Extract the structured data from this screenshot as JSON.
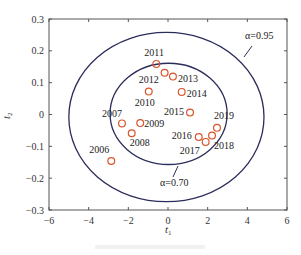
{
  "chart_data": {
    "type": "scatter",
    "title": "",
    "xlabel": "t1",
    "ylabel": "t2",
    "xlim": [
      -6,
      6
    ],
    "ylim": [
      -0.3,
      0.3
    ],
    "xticks": [
      -6,
      -4,
      -2,
      0,
      2,
      4,
      6
    ],
    "xtick_labels": [
      "−6",
      "−4",
      "−2",
      "0",
      "2",
      "4",
      "6"
    ],
    "yticks": [
      0.3,
      0.2,
      0.1,
      0,
      -0.1,
      -0.2,
      -0.3
    ],
    "ytick_labels": [
      "0.3",
      "0.2",
      "0.1",
      "0",
      "−0.1",
      "−0.2",
      "−0.3"
    ],
    "grid": false,
    "legend": null,
    "series": [
      {
        "name": "years",
        "marker": "open-circle",
        "color": "#d9542b",
        "points": [
          {
            "label": "2006",
            "x": -2.86,
            "y": -0.146
          },
          {
            "label": "2007",
            "x": -2.32,
            "y": -0.028
          },
          {
            "label": "2008",
            "x": -1.83,
            "y": -0.059
          },
          {
            "label": "2009",
            "x": -1.4,
            "y": -0.027
          },
          {
            "label": "2010",
            "x": -0.97,
            "y": 0.072
          },
          {
            "label": "2011",
            "x": -0.59,
            "y": 0.159
          },
          {
            "label": "2012",
            "x": -0.17,
            "y": 0.131
          },
          {
            "label": "2013",
            "x": 0.25,
            "y": 0.119
          },
          {
            "label": "2014",
            "x": 0.69,
            "y": 0.071
          },
          {
            "label": "2015",
            "x": 1.11,
            "y": 0.006
          },
          {
            "label": "2016",
            "x": 1.55,
            "y": -0.071
          },
          {
            "label": "2017",
            "x": 1.9,
            "y": -0.086
          },
          {
            "label": "2018",
            "x": 2.22,
            "y": -0.066
          },
          {
            "label": "2019",
            "x": 2.47,
            "y": -0.042
          }
        ]
      }
    ],
    "ellipses": [
      {
        "name": "confidence-0.95",
        "label": "α=0.95",
        "cx": -0.08,
        "cy": -0.008,
        "rx": 4.92,
        "ry": 0.266,
        "color": "#2b2d5a"
      },
      {
        "name": "confidence-0.70",
        "label": "α=0.70",
        "cx": 0.03,
        "cy": 0.002,
        "rx": 2.95,
        "ry": 0.159,
        "color": "#2b2d5a"
      }
    ],
    "annotations": [
      "α=0.95",
      "α=0.70"
    ]
  },
  "labels": {
    "x_axis": "t",
    "x_axis_sub": "1",
    "y_axis": "t",
    "y_axis_sub": "2",
    "alpha_outer": "α=0.95",
    "alpha_inner": "α=0.70"
  },
  "colors": {
    "marker": "#d9542b",
    "ellipse": "#2b2d5a",
    "axis": "#555555"
  }
}
